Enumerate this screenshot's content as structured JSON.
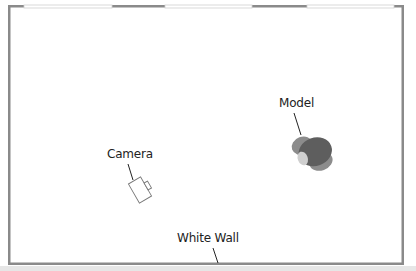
{
  "diagram": {
    "type": "studio-lighting-floor-plan",
    "colors": {
      "wall": "#8a8a8a",
      "window": "#ffffff",
      "window_edge": "#cfcfcf",
      "model_dark": "#5e5e5e",
      "model_mid": "#8c8c8c",
      "model_light": "#cfcfcf",
      "camera_stroke": "#777777",
      "leader": "#222222",
      "floor_strip": "#e6e6e6"
    },
    "labels": {
      "model": "Model",
      "camera": "Camera",
      "white_wall": "White Wall"
    },
    "elements": [
      {
        "name": "room-walls",
        "label": ""
      },
      {
        "name": "window-1",
        "label": ""
      },
      {
        "name": "window-2",
        "label": ""
      },
      {
        "name": "window-3",
        "label": ""
      },
      {
        "name": "model",
        "label": "Model"
      },
      {
        "name": "camera",
        "label": "Camera"
      },
      {
        "name": "white-wall",
        "label": "White Wall"
      }
    ]
  }
}
